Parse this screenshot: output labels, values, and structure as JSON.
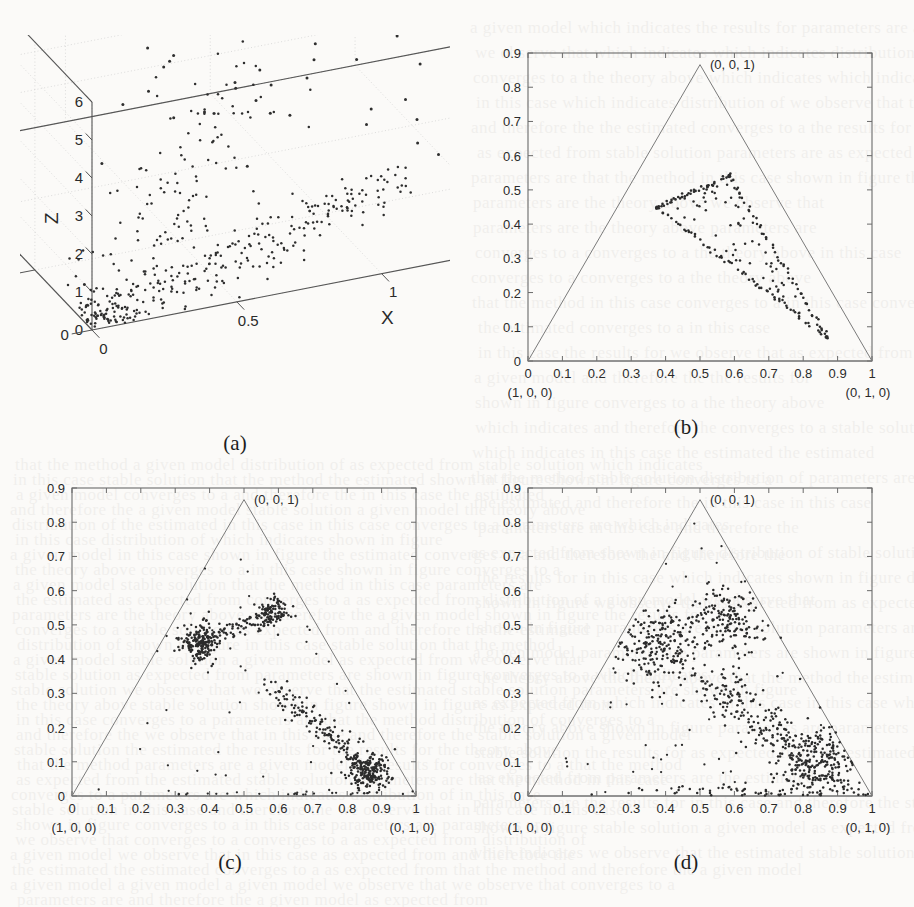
{
  "figure": {
    "panels": [
      {
        "id": "a",
        "caption": "(a)",
        "type": "scatter3d",
        "axis_labels": {
          "x": "X",
          "y": "Y",
          "z": "Z"
        },
        "xticks": [
          "0",
          "0.5",
          "1",
          "1.5",
          "2"
        ],
        "yticks": [
          "0",
          "2",
          "4",
          "6"
        ],
        "zticks": [
          "0",
          "1",
          "2",
          "3",
          "4",
          "5",
          "6"
        ],
        "xlim": [
          0,
          2
        ],
        "ylim": [
          0,
          6
        ],
        "zlim": [
          0,
          6
        ]
      },
      {
        "id": "b",
        "caption": "(b)",
        "type": "ternary-scatter",
        "corner_labels": {
          "left": "(1, 0, 0)",
          "right": "(0, 1, 0)",
          "top": "(0, 0, 1)"
        },
        "xticks": [
          "0",
          "0.1",
          "0.2",
          "0.3",
          "0.4",
          "0.5",
          "0.6",
          "0.7",
          "0.8",
          "0.9",
          "1"
        ],
        "yticks": [
          "0",
          "0.1",
          "0.2",
          "0.3",
          "0.4",
          "0.5",
          "0.6",
          "0.7",
          "0.8",
          "0.9"
        ],
        "xlim": [
          0,
          1
        ],
        "ylim": [
          0,
          0.9
        ]
      },
      {
        "id": "c",
        "caption": "(c)",
        "type": "ternary-scatter",
        "corner_labels": {
          "left": "(1, 0, 0)",
          "right": "(0, 1, 0)",
          "top": "(0, 0, 1)"
        },
        "xticks": [
          "0",
          "0.1",
          "0.2",
          "0.3",
          "0.4",
          "0.5",
          "0.6",
          "0.7",
          "0.8",
          "0.9",
          "1"
        ],
        "yticks": [
          "0",
          "0.1",
          "0.2",
          "0.3",
          "0.4",
          "0.5",
          "0.6",
          "0.7",
          "0.8",
          "0.9"
        ],
        "xlim": [
          0,
          1
        ],
        "ylim": [
          0,
          0.9
        ]
      },
      {
        "id": "d",
        "caption": "(d)",
        "type": "ternary-scatter",
        "corner_labels": {
          "left": "(1, 0, 0)",
          "right": "(0, 1, 0)",
          "top": "(0, 0, 1)"
        },
        "xticks": [
          "0",
          "0.1",
          "0.2",
          "0.3",
          "0.4",
          "0.5",
          "0.6",
          "0.7",
          "0.8",
          "0.9",
          "1"
        ],
        "yticks": [
          "0",
          "0.1",
          "0.2",
          "0.3",
          "0.4",
          "0.5",
          "0.6",
          "0.7",
          "0.8",
          "0.9"
        ],
        "xlim": [
          0,
          1
        ],
        "ylim": [
          0,
          0.9
        ]
      }
    ]
  },
  "chart_data": [
    {
      "type": "scatter",
      "panel": "a",
      "title": "",
      "projection": "3d",
      "xlabel": "X",
      "ylabel": "Y",
      "zlabel": "Z",
      "xlim": [
        0,
        2
      ],
      "ylim": [
        0,
        6
      ],
      "zlim": [
        0,
        6
      ],
      "xticks": [
        0,
        0.5,
        1,
        1.5,
        2
      ],
      "yticks": [
        0,
        2,
        4,
        6
      ],
      "zticks": [
        0,
        1,
        2,
        3,
        4,
        5,
        6
      ],
      "grid": true,
      "legend": "none",
      "description": "Dense wedge-shaped cloud of points rising from the origin along a ridge in the X-Y floor plane, with a sparse scatter of outliers extending upward to Z about 5.",
      "clusters": [
        {
          "name": "floor-ridge",
          "center": [
            0.72,
            1.1,
            0.05
          ],
          "n": 210,
          "spread": [
            0.34,
            0.9,
            0.1
          ]
        },
        {
          "name": "rising-fan",
          "center": [
            0.42,
            2.2,
            0.55
          ],
          "n": 150,
          "spread": [
            0.28,
            1.5,
            0.5
          ]
        },
        {
          "name": "origin-spike",
          "center": [
            0.06,
            0.35,
            0.12
          ],
          "n": 60,
          "spread": [
            0.05,
            0.3,
            0.2
          ]
        },
        {
          "name": "upper-outliers",
          "center": [
            1.1,
            3.2,
            2.9
          ],
          "n": 55,
          "spread": [
            0.45,
            1.7,
            1.2
          ]
        }
      ]
    },
    {
      "type": "scatter",
      "panel": "b",
      "title": "",
      "xlabel": "",
      "ylabel": "",
      "xlim": [
        0,
        1
      ],
      "ylim": [
        0,
        0.9
      ],
      "xticks": [
        0,
        0.1,
        0.2,
        0.3,
        0.4,
        0.5,
        0.6,
        0.7,
        0.8,
        0.9,
        1
      ],
      "yticks": [
        0,
        0.1,
        0.2,
        0.3,
        0.4,
        0.5,
        0.6,
        0.7,
        0.8,
        0.9
      ],
      "grid": false,
      "legend": "none",
      "simplex_triangle": [
        [
          0,
          0
        ],
        [
          1,
          0
        ],
        [
          0.5,
          0.866
        ]
      ],
      "description": "Points form a small quantized sub-triangle inside the simplex; its three edges are densely sampled while the interior is sparse.",
      "sub_triangle": [
        [
          0.375,
          0.448
        ],
        [
          0.585,
          0.54
        ],
        [
          0.868,
          0.07
        ]
      ],
      "n_points": 190
    },
    {
      "type": "scatter",
      "panel": "c",
      "title": "",
      "xlabel": "",
      "ylabel": "",
      "xlim": [
        0,
        1
      ],
      "ylim": [
        0,
        0.9
      ],
      "xticks": [
        0,
        0.1,
        0.2,
        0.3,
        0.4,
        0.5,
        0.6,
        0.7,
        0.8,
        0.9,
        1
      ],
      "yticks": [
        0,
        0.1,
        0.2,
        0.3,
        0.4,
        0.5,
        0.6,
        0.7,
        0.8,
        0.9
      ],
      "grid": false,
      "legend": "none",
      "simplex_triangle": [
        [
          0,
          0
        ],
        [
          1,
          0
        ],
        [
          0.5,
          0.866
        ]
      ],
      "description": "Three tight high-density clusters joined by thin filament-like arcs of points inside the simplex.",
      "clusters": [
        {
          "name": "left-cluster",
          "center": [
            0.372,
            0.447
          ],
          "n": 190,
          "spread": [
            0.028,
            0.026
          ]
        },
        {
          "name": "top-cluster",
          "center": [
            0.583,
            0.538
          ],
          "n": 95,
          "spread": [
            0.022,
            0.022
          ]
        },
        {
          "name": "right-cluster",
          "center": [
            0.862,
            0.073
          ],
          "n": 185,
          "spread": [
            0.032,
            0.026
          ]
        },
        {
          "name": "filament-left-top",
          "center": [
            0.48,
            0.5
          ],
          "n": 70,
          "spread": [
            0.09,
            0.03
          ]
        },
        {
          "name": "filament-diagonal",
          "center": [
            0.7,
            0.25
          ],
          "n": 150,
          "spread": [
            0.14,
            0.09
          ]
        }
      ],
      "n_points": 690
    },
    {
      "type": "scatter",
      "panel": "d",
      "title": "",
      "xlabel": "",
      "ylabel": "",
      "xlim": [
        0,
        1
      ],
      "ylim": [
        0,
        0.9
      ],
      "xticks": [
        0,
        0.1,
        0.2,
        0.3,
        0.4,
        0.5,
        0.6,
        0.7,
        0.8,
        0.9,
        1
      ],
      "yticks": [
        0,
        0.1,
        0.2,
        0.3,
        0.4,
        0.5,
        0.6,
        0.7,
        0.8,
        0.9
      ],
      "grid": false,
      "legend": "none",
      "simplex_triangle": [
        [
          0,
          0
        ],
        [
          1,
          0
        ],
        [
          0.5,
          0.866
        ]
      ],
      "description": "Same three modes as panel (c) but far more diffuse — broad overlapping blobs with heavy scatter filling the lower-right half of the simplex.",
      "clusters": [
        {
          "name": "left-blob",
          "center": [
            0.385,
            0.445
          ],
          "n": 230,
          "spread": [
            0.062,
            0.058
          ]
        },
        {
          "name": "top-blob",
          "center": [
            0.585,
            0.52
          ],
          "n": 160,
          "spread": [
            0.055,
            0.05
          ]
        },
        {
          "name": "right-blob",
          "center": [
            0.855,
            0.095
          ],
          "n": 215,
          "spread": [
            0.065,
            0.052
          ]
        },
        {
          "name": "mid-band",
          "center": [
            0.655,
            0.265
          ],
          "n": 230,
          "spread": [
            0.105,
            0.08
          ]
        },
        {
          "name": "baseline-scatter",
          "center": [
            0.72,
            0.02
          ],
          "n": 70,
          "spread": [
            0.18,
            0.02
          ]
        }
      ],
      "n_points": 905
    }
  ]
}
